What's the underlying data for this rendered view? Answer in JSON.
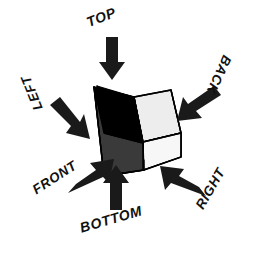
{
  "diagram": {
    "type": "engineering-orthographic-view-key",
    "background_color": "#ffffff",
    "object": {
      "name": "angle-block-wedge",
      "faces": [
        {
          "name": "front-face",
          "fill": "#000000",
          "label": "FRONT"
        },
        {
          "name": "left-face",
          "fill": "#3a3a3a",
          "label": "LEFT"
        },
        {
          "name": "inner-ramp-face",
          "fill": "#111111",
          "label": ""
        },
        {
          "name": "top-face",
          "fill": "#e8e8e8",
          "label": "TOP"
        },
        {
          "name": "right-face",
          "fill": "#f2f2f2",
          "label": "RIGHT"
        },
        {
          "name": "base-face",
          "fill": "#fafafa",
          "label": "BOTTOM"
        }
      ],
      "outline_color": "#000000"
    },
    "callouts": [
      {
        "id": "top",
        "label": "TOP",
        "arrow_direction": "down",
        "arrow_angle_deg": 90,
        "label_rotation_deg": -22
      },
      {
        "id": "left",
        "label": "LEFT",
        "arrow_direction": "down-right",
        "arrow_angle_deg": 38,
        "label_rotation_deg": 248
      },
      {
        "id": "back",
        "label": "BACK",
        "arrow_direction": "down-left",
        "arrow_angle_deg": 208,
        "label_rotation_deg": 115
      },
      {
        "id": "front",
        "label": "FRONT",
        "arrow_direction": "up-right",
        "arrow_angle_deg": -42,
        "label_rotation_deg": -33
      },
      {
        "id": "bottom",
        "label": "BOTTOM",
        "arrow_direction": "up",
        "arrow_angle_deg": -90,
        "label_rotation_deg": -16
      },
      {
        "id": "right",
        "label": "RIGHT",
        "arrow_direction": "up-left",
        "arrow_angle_deg": 215,
        "label_rotation_deg": -60
      }
    ],
    "arrow_color": "#1a1a1a"
  }
}
